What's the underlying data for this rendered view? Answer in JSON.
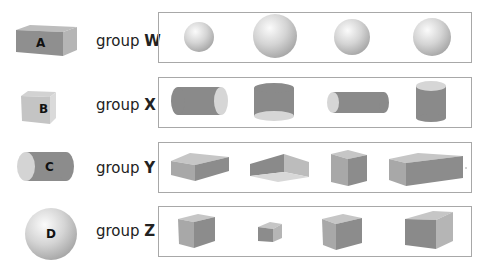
{
  "reference_shapes": [
    {
      "letter": "A",
      "shape": "rectangular prism"
    },
    {
      "letter": "B",
      "shape": "cube"
    },
    {
      "letter": "C",
      "shape": "cylinder"
    },
    {
      "letter": "D",
      "shape": "sphere"
    }
  ],
  "groups": [
    {
      "prefix": "group",
      "name": "W",
      "members": [
        "sphere",
        "sphere",
        "sphere",
        "sphere"
      ]
    },
    {
      "prefix": "group",
      "name": "X",
      "members": [
        "cylinder",
        "cylinder",
        "cylinder",
        "cylinder"
      ]
    },
    {
      "prefix": "group",
      "name": "Y",
      "members": [
        "rectangular prism",
        "open rectangular prism",
        "rectangular prism",
        "rectangular prism"
      ]
    },
    {
      "prefix": "group",
      "name": "Z",
      "members": [
        "cube",
        "cube",
        "cube",
        "cube"
      ]
    }
  ],
  "colors": {
    "dark_face": "#8a8a8a",
    "mid_face": "#a9a9a9",
    "light_face": "#cfcfcf",
    "box_border": "#a8a8a8"
  }
}
